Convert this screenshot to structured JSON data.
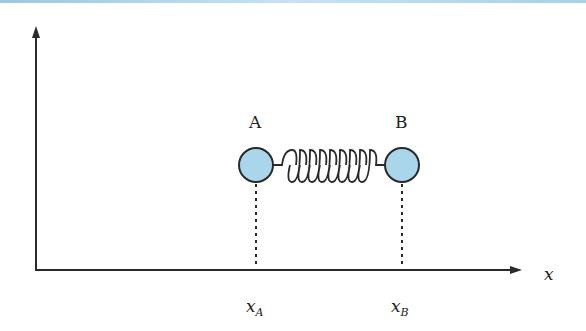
{
  "diagram": {
    "type": "physics-spring-system",
    "axis": {
      "x_label": "x"
    },
    "masses": [
      {
        "label": "A",
        "position_label_base": "x",
        "position_label_sub": "A",
        "fill": "#a9d6ea"
      },
      {
        "label": "B",
        "position_label_base": "x",
        "position_label_sub": "B",
        "fill": "#a9d6ea"
      }
    ],
    "spring": {
      "coils": 9
    },
    "colors": {
      "line": "#2a2a2a",
      "mass_fill": "#a9d6ea",
      "top_bar": "#a8d0e6"
    }
  }
}
